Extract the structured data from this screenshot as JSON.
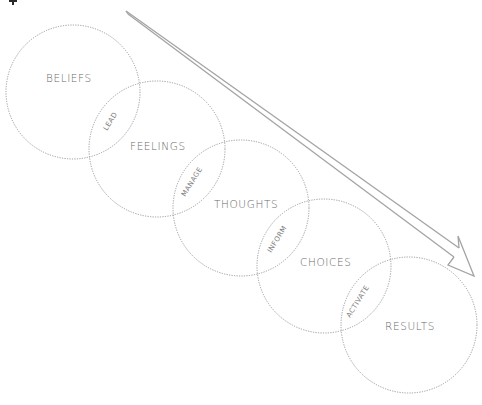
{
  "diagram": {
    "type": "overlapping-circles-flow",
    "colors": {
      "background": "#ffffff",
      "circle_stroke": "#9a9a9a",
      "text": "#6a6a6a",
      "arrow": "#a4a4a4"
    },
    "stages": [
      {
        "label": "BELIEFS",
        "cx": 73,
        "cy": 92,
        "r": 67,
        "tx": 46,
        "ty": 82
      },
      {
        "label": "FEELINGS",
        "cx": 157,
        "cy": 149,
        "r": 68,
        "tx": 130,
        "ty": 150
      },
      {
        "label": "THOUGHTS",
        "cx": 241,
        "cy": 208,
        "r": 68,
        "tx": 214,
        "ty": 208
      },
      {
        "label": "CHOICES",
        "cx": 324,
        "cy": 266,
        "r": 67,
        "tx": 300,
        "ty": 266
      },
      {
        "label": "RESULTS",
        "cx": 409,
        "cy": 325,
        "r": 68,
        "tx": 385,
        "ty": 330
      }
    ],
    "links": [
      {
        "label": "LEAD",
        "x": 114,
        "y": 122,
        "angle": -58
      },
      {
        "label": "MANAGE",
        "x": 196,
        "y": 180,
        "angle": -58
      },
      {
        "label": "INFORM",
        "x": 281,
        "y": 238,
        "angle": -58
      },
      {
        "label": "ACTIVATE",
        "x": 364,
        "y": 297,
        "angle": -58
      }
    ],
    "arrow": {
      "direction": "down-right",
      "start": [
        127,
        12
      ],
      "tip": [
        474,
        276
      ]
    }
  }
}
